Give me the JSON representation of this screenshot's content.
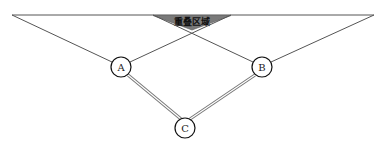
{
  "diagram": {
    "overlap_region": {
      "label": "重叠区域",
      "fill": "#7a7a7a",
      "points": [
        [
          153,
          16
        ],
        [
          231,
          16
        ],
        [
          192,
          30
        ]
      ]
    },
    "top_line": {
      "x1": 12,
      "y1": 15,
      "x2": 374,
      "y2": 15
    },
    "nodes": [
      {
        "id": "A",
        "label": "A",
        "cx": 121,
        "cy": 67,
        "r": 10
      },
      {
        "id": "B",
        "label": "B",
        "cx": 262,
        "cy": 67,
        "r": 10
      },
      {
        "id": "C",
        "label": "C",
        "cx": 185,
        "cy": 128,
        "r": 10
      }
    ],
    "edges": [
      {
        "from": "top-left",
        "to": "A",
        "style": "single"
      },
      {
        "from": "A",
        "to": "overlap-right",
        "style": "single"
      },
      {
        "from": "top-right",
        "to": "B",
        "style": "single"
      },
      {
        "from": "B",
        "to": "overlap-left",
        "style": "single"
      },
      {
        "from": "A",
        "to": "C",
        "style": "double"
      },
      {
        "from": "B",
        "to": "C",
        "style": "double"
      }
    ]
  }
}
